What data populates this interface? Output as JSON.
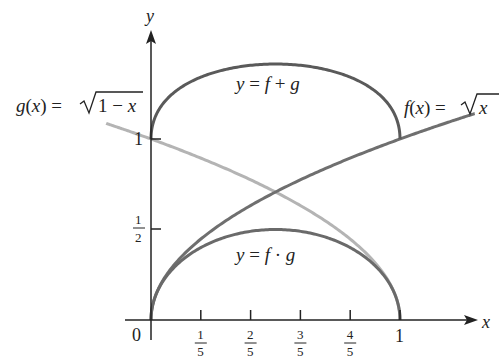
{
  "chart_data": {
    "type": "line",
    "title": "",
    "xlabel": "x",
    "ylabel": "y",
    "xlim": [
      0,
      1.3
    ],
    "ylim": [
      0,
      1.45
    ],
    "x_ticks": [
      "1/5",
      "2/5",
      "3/5",
      "4/5",
      "1"
    ],
    "x_tick_values": [
      0.2,
      0.4,
      0.6,
      0.8,
      1.0
    ],
    "y_ticks": [
      "1/2",
      "1"
    ],
    "y_tick_values": [
      0.5,
      1.0
    ],
    "origin_label": "0",
    "grid": false,
    "series": [
      {
        "name": "f(x) = √x",
        "label": "f(x) = √x",
        "domain": [
          0,
          1.3
        ],
        "color": "#6f6f6f",
        "x": [
          0,
          0.2,
          0.4,
          0.6,
          0.8,
          1.0,
          1.3
        ],
        "values": [
          0,
          0.447,
          0.632,
          0.775,
          0.894,
          1.0,
          1.14
        ]
      },
      {
        "name": "g(x) = √(1 − x)",
        "label": "g(x) = √1 − x",
        "domain": [
          -0.18,
          1
        ],
        "color": "#b4b4b4",
        "x": [
          -0.18,
          0,
          0.2,
          0.4,
          0.6,
          0.8,
          1.0
        ],
        "values": [
          1.086,
          1.0,
          0.894,
          0.775,
          0.632,
          0.447,
          0
        ]
      },
      {
        "name": "y = f + g",
        "label": "y = f + g",
        "domain": [
          0,
          1
        ],
        "color": "#5a5a5a",
        "x": [
          0,
          0.2,
          0.4,
          0.5,
          0.6,
          0.8,
          1.0
        ],
        "values": [
          1.0,
          1.341,
          1.407,
          1.414,
          1.407,
          1.341,
          1.0
        ]
      },
      {
        "name": "y = f · g",
        "label": "y = f · g",
        "domain": [
          0,
          1
        ],
        "color": "#6a6a6a",
        "x": [
          0,
          0.2,
          0.4,
          0.5,
          0.6,
          0.8,
          1.0
        ],
        "values": [
          0,
          0.4,
          0.49,
          0.5,
          0.49,
          0.4,
          0
        ]
      }
    ]
  },
  "labels": {
    "g_fn": "g(x) = ",
    "g_rad": "1 − x",
    "f_fn": "f(x) = ",
    "f_rad": "x",
    "sum": "y = f + g",
    "prod": "y = f · g",
    "x_axis": "x",
    "y_axis": "y",
    "origin": "0",
    "y_one": "1",
    "y_half_num": "1",
    "y_half_den": "2",
    "x_ticks": [
      {
        "num": "1",
        "den": "5"
      },
      {
        "num": "2",
        "den": "5"
      },
      {
        "num": "3",
        "den": "5"
      },
      {
        "num": "4",
        "den": "5"
      }
    ],
    "x_one": "1"
  }
}
